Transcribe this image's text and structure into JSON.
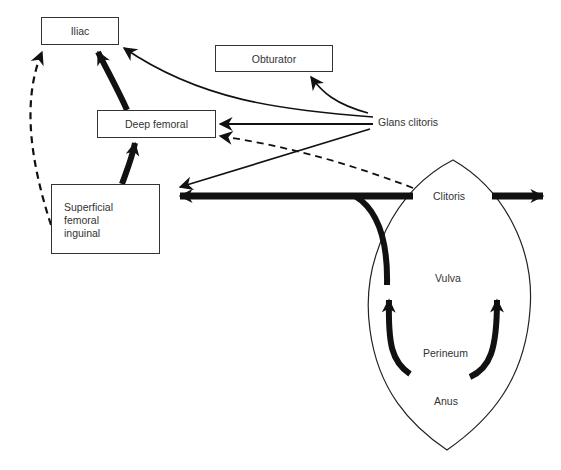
{
  "diagram": {
    "type": "lymphatic-drainage-flow",
    "nodes": {
      "iliac": {
        "label": "Iliac"
      },
      "obturator": {
        "label": "Obturator"
      },
      "deep_femoral": {
        "label": "Deep femoral"
      },
      "superficial": {
        "lines": [
          "Superficial",
          "femoral",
          "inguinal"
        ]
      },
      "glans_clitoris": {
        "label": "Glans clitoris"
      },
      "clitoris": {
        "label": "Clitoris"
      },
      "vulva": {
        "label": "Vulva"
      },
      "perineum": {
        "label": "Perineum"
      },
      "anus": {
        "label": "Anus"
      }
    },
    "edges": [
      {
        "from": "Superficial femoral inguinal",
        "to": "Iliac",
        "style": "dashed"
      },
      {
        "from": "Deep femoral",
        "to": "Iliac",
        "style": "thick"
      },
      {
        "from": "Superficial femoral inguinal",
        "to": "Deep femoral",
        "style": "thick"
      },
      {
        "from": "Glans clitoris",
        "to": "Iliac",
        "style": "thin"
      },
      {
        "from": "Glans clitoris",
        "to": "Obturator",
        "style": "thin"
      },
      {
        "from": "Glans clitoris",
        "to": "Deep femoral",
        "style": "thin"
      },
      {
        "from": "Clitoris",
        "to": "Deep femoral",
        "style": "dashed"
      },
      {
        "from": "Glans clitoris",
        "to": "Superficial femoral inguinal",
        "style": "thin"
      },
      {
        "from": "Clitoris",
        "to": "Superficial femoral inguinal",
        "style": "thick"
      },
      {
        "from": "Clitoris",
        "to": "contralateral",
        "style": "thick"
      },
      {
        "from": "Vulva",
        "to": "Clitoris",
        "style": "thick"
      },
      {
        "from": "Perineum",
        "to": "Vulva",
        "style": "thick"
      }
    ],
    "colors": {
      "line": "#111111",
      "box_border": "#333333",
      "background": "#ffffff"
    }
  }
}
